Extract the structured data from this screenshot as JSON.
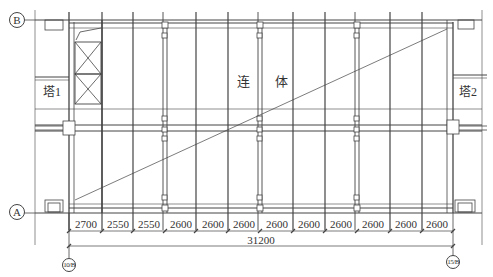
{
  "diagram": {
    "type": "structural-plan",
    "axes": {
      "top_row": "B",
      "bottom_row": "A",
      "left_column": "10/B",
      "right_column": "15/B"
    },
    "towers": {
      "left": "塔1",
      "right": "塔2"
    },
    "center_label": {
      "left_char": "连",
      "right_char": "体"
    },
    "bay_dimensions": [
      "2700",
      "2550",
      "2550",
      "2600",
      "2600",
      "2600",
      "2600",
      "2600",
      "2600",
      "2600",
      "2600",
      "2600"
    ],
    "total_dimension": "31200",
    "colors": {
      "line": "#333333",
      "background": "#ffffff"
    }
  }
}
